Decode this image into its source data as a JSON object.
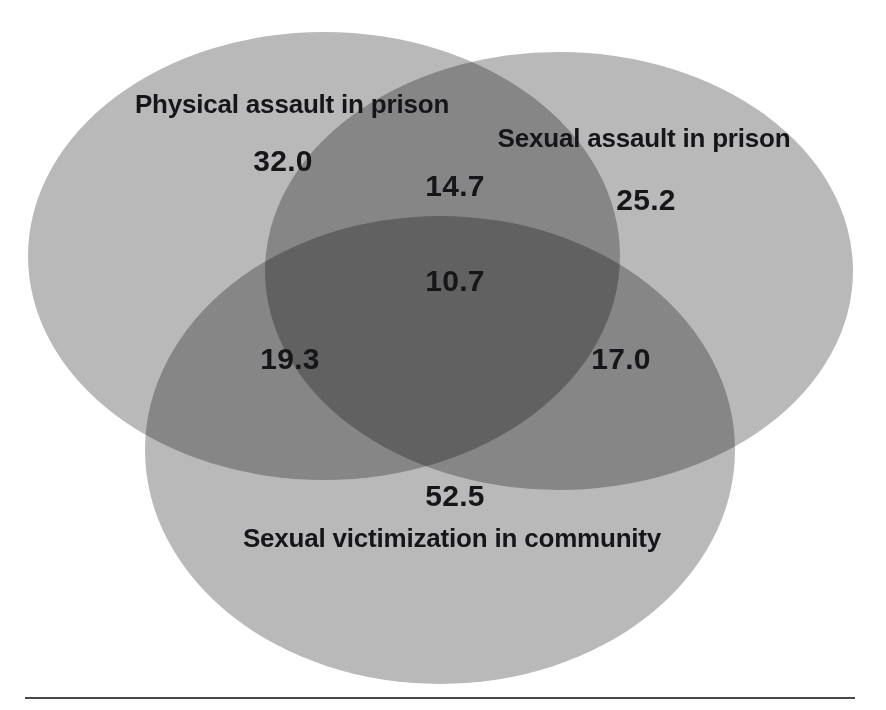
{
  "figure": {
    "type": "venn-diagram",
    "background_color": "#ffffff",
    "width": 886,
    "height": 710
  },
  "sets": [
    {
      "id": "physical-assault-prison",
      "label": "Physical assault in prison",
      "label_x": 292,
      "label_y": 105,
      "fill": "#b9b9b9",
      "cx": 324,
      "cy": 256,
      "rx": 296,
      "ry": 224
    },
    {
      "id": "sexual-assault-prison",
      "label": "Sexual assault in prison",
      "label_x": 644,
      "label_y": 139,
      "fill": "#b9b9b9",
      "cx": 559,
      "cy": 271,
      "rx": 294,
      "ry": 219
    },
    {
      "id": "sexual-victimization-community",
      "label": "Sexual victimization in community",
      "label_x": 452,
      "label_y": 539,
      "fill": "#b9b9b9",
      "cx": 440,
      "cy": 450,
      "rx": 295,
      "ry": 234
    }
  ],
  "regions": [
    {
      "id": "physical-only",
      "value": "32.0",
      "x": 283,
      "y": 161
    },
    {
      "id": "sexual-assault-only",
      "value": "25.2",
      "x": 646,
      "y": 200
    },
    {
      "id": "community-only",
      "value": "52.5",
      "x": 455,
      "y": 496
    },
    {
      "id": "physical-and-sexual",
      "value": "14.7",
      "x": 455,
      "y": 186
    },
    {
      "id": "physical-and-community",
      "value": "19.3",
      "x": 290,
      "y": 359
    },
    {
      "id": "sexual-and-community",
      "value": "17.0",
      "x": 621,
      "y": 359
    },
    {
      "id": "all-three",
      "value": "10.7",
      "x": 455,
      "y": 281
    }
  ],
  "chart_data": {
    "type": "venn",
    "title": "",
    "sets": [
      "Physical assault in prison",
      "Sexual assault in prison",
      "Sexual victimization in community"
    ],
    "unit": "percent",
    "values": {
      "Physical assault in prison only": 32.0,
      "Sexual assault in prison only": 25.2,
      "Sexual victimization in community only": 52.5,
      "Physical assault in prison & Sexual assault in prison": 14.7,
      "Physical assault in prison & Sexual victimization in community": 19.3,
      "Sexual assault in prison & Sexual victimization in community": 17.0,
      "All three": 10.7
    },
    "labels": [
      "32.0",
      "25.2",
      "52.5",
      "14.7",
      "19.3",
      "17.0",
      "10.7"
    ],
    "legend_position": "inline",
    "grid": false,
    "colors": {
      "single_overlap": "#b9b9b9",
      "double_overlap": "#8e8e8e",
      "triple_overlap": "#7d7d7d",
      "text": "#16161a",
      "rule": "#4a4a4a"
    }
  },
  "divider": {
    "name": "bottom-horizontal-rule",
    "x": 25,
    "y": 697,
    "width": 830
  }
}
